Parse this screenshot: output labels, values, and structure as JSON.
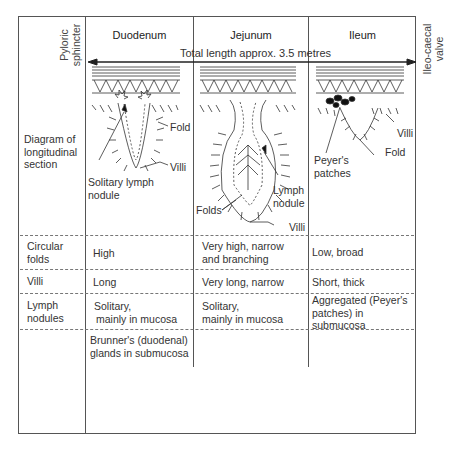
{
  "columns": {
    "header_duodenum": "Duodenum",
    "header_jejunum": "Jejunum",
    "header_ileum": "Ileum"
  },
  "length_arrow": {
    "label": "Total length approx. 3.5 metres",
    "left_end_label_1": "Pyloric",
    "left_end_label_2": "sphincter",
    "right_end_label_1": "Ileo-caecal",
    "right_end_label_2": "valve"
  },
  "rows": {
    "diagram": {
      "label_1": "Diagram of",
      "label_2": "longitudinal",
      "label_3": "section"
    },
    "circular_folds": {
      "label_1": "Circular",
      "label_2": "folds",
      "duodenum": "High",
      "jejunum_1": "Very high, narrow",
      "jejunum_2": "and branching",
      "ileum": "Low, broad"
    },
    "villi": {
      "label": "Villi",
      "duodenum": "Long",
      "jejunum": "Very long, narrow",
      "ileum": "Short, thick"
    },
    "lymph_nodules": {
      "label_1": "Lymph",
      "label_2": "nodules",
      "duodenum_1": "Solitary,",
      "duodenum_2": "mainly in mucosa",
      "jejunum_1": "Solitary,",
      "jejunum_2": "mainly in mucosa",
      "ileum_1": "Aggregated (Peyer's",
      "ileum_2": "patches) in",
      "ileum_3": "submucosa"
    },
    "glands": {
      "duodenum_1": "Brunner's (duodenal)",
      "duodenum_2": "glands in submucosa"
    }
  },
  "diagram_labels": {
    "duodenum_fold": "Fold",
    "duodenum_villi": "Villi",
    "duodenum_nodule_1": "Solitary lymph",
    "duodenum_nodule_2": "nodule",
    "jejunum_folds": "Folds",
    "jejunum_nodule_1": "Lymph",
    "jejunum_nodule_2": "nodule",
    "jejunum_villi": "Villi",
    "ileum_villi": "Villi",
    "ileum_fold": "Fold",
    "ileum_patches_1": "Peyer's",
    "ileum_patches_2": "patches"
  },
  "colors": {
    "line": "#555555",
    "text": "#333333",
    "dashed": "#777777"
  }
}
